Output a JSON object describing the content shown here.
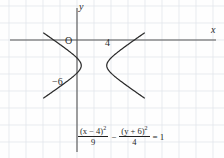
{
  "figure": {
    "kind": "hyperbola-graph",
    "axes": {
      "x_label": "x",
      "y_label": "y",
      "origin_label": "O",
      "x_tick_label": "4",
      "y_tick_label": "−6",
      "x_axis_y_px": 40,
      "y_axis_x_px": 77,
      "grid_spacing_px": 17,
      "grid_visible": true,
      "grid_color": "#dfe4ea",
      "axis_color": "#555555",
      "curve_color": "#2b2b2b"
    },
    "equation": {
      "num1_pre": "(x − 4)",
      "num1_sup": "2",
      "den1": "9",
      "operator": "−",
      "num2_pre": "(y + 6)",
      "num2_sup": "2",
      "den2": "4",
      "equals": "= 1"
    }
  },
  "chart_data": {
    "type": "line",
    "title": "",
    "xlabel": "x",
    "ylabel": "y",
    "grid": true,
    "legend": "none",
    "equation_latex": "(x-4)^2/9 - (y+6)^2/4 = 1",
    "conic": {
      "name": "hyperbola",
      "orientation": "horizontal",
      "center": [
        4,
        -6
      ],
      "a": 3,
      "b": 2,
      "vertices": [
        [
          1,
          -6
        ],
        [
          7,
          -6
        ]
      ],
      "asymptote_slopes": [
        0.6667,
        -0.6667
      ]
    },
    "xlim": [
      -4.5,
      12.5
    ],
    "ylim": [
      -12.5,
      2.5
    ],
    "tick_labels": {
      "x": [
        "4"
      ],
      "y": [
        "-6"
      ]
    },
    "series": [
      {
        "name": "left-branch",
        "points": [
          [
            -3.4,
            -1.4
          ],
          [
            -2.6,
            -2.2
          ],
          [
            -1.8,
            -3.1
          ],
          [
            -1.0,
            -4.0
          ],
          [
            -0.2,
            -5.0
          ],
          [
            0.55,
            -6.0
          ],
          [
            -0.2,
            -7.0
          ],
          [
            -1.0,
            -8.0
          ],
          [
            -1.8,
            -8.9
          ],
          [
            -2.6,
            -9.8
          ],
          [
            -3.4,
            -10.6
          ]
        ]
      },
      {
        "name": "right-branch",
        "points": [
          [
            11.4,
            -1.4
          ],
          [
            10.6,
            -2.2
          ],
          [
            9.8,
            -3.1
          ],
          [
            9.0,
            -4.0
          ],
          [
            8.2,
            -5.0
          ],
          [
            7.45,
            -6.0
          ],
          [
            8.2,
            -7.0
          ],
          [
            9.0,
            -8.0
          ],
          [
            9.8,
            -8.9
          ],
          [
            10.6,
            -9.8
          ],
          [
            11.4,
            -10.6
          ]
        ]
      }
    ]
  }
}
